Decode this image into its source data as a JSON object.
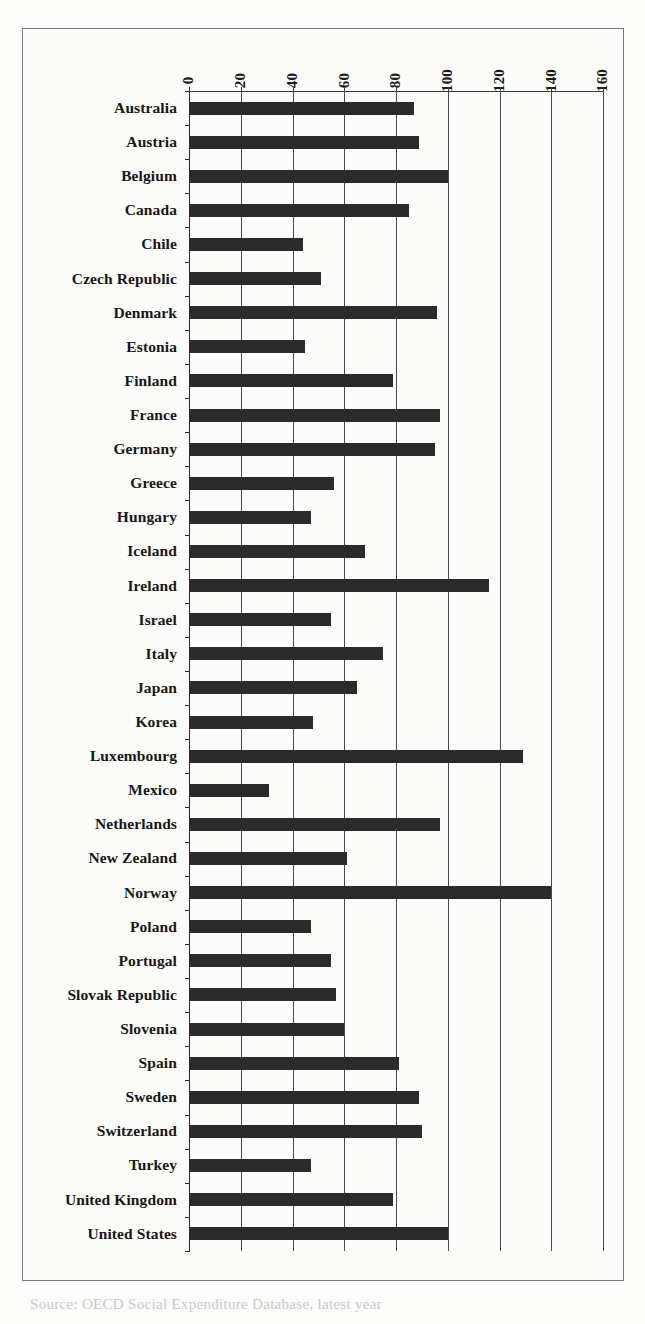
{
  "figure": {
    "caption_fragment": "Source: OECD Social Expenditure Database, latest year",
    "frame_color": "#7c7c7c",
    "bar_color": "#2b2b2b",
    "grid_color": "#4a4a4a",
    "background": "#fcfcfa"
  },
  "chart_data": {
    "type": "bar",
    "orientation": "horizontal",
    "title": "",
    "subtitle": "",
    "xlabel": "",
    "ylabel": "",
    "xlim": [
      0,
      160
    ],
    "ylim": null,
    "grid": true,
    "grid_axis": "x",
    "legend": false,
    "legend_position": "none",
    "x_axis_position": "top",
    "xticks": [
      0,
      20,
      40,
      60,
      80,
      100,
      120,
      140,
      160
    ],
    "xtick_labels": [
      "0",
      "20",
      "40",
      "60",
      "80",
      "100",
      "120",
      "140",
      "160"
    ],
    "xtick_label_rotation": -90,
    "categories": [
      "Australia",
      "Austria",
      "Belgium",
      "Canada",
      "Chile",
      "Czech Republic",
      "Denmark",
      "Estonia",
      "Finland",
      "France",
      "Germany",
      "Greece",
      "Hungary",
      "Iceland",
      "Ireland",
      "Israel",
      "Italy",
      "Japan",
      "Korea",
      "Luxembourg",
      "Mexico",
      "Netherlands",
      "New Zealand",
      "Norway",
      "Poland",
      "Portugal",
      "Slovak Republic",
      "Slovenia",
      "Spain",
      "Sweden",
      "Switzerland",
      "Turkey",
      "United Kingdom",
      "United States"
    ],
    "values": [
      87,
      89,
      100,
      85,
      44,
      51,
      96,
      45,
      79,
      97,
      95,
      56,
      47,
      68,
      116,
      55,
      75,
      65,
      48,
      129,
      31,
      97,
      61,
      140,
      47,
      55,
      57,
      60,
      81,
      89,
      90,
      47,
      79,
      100
    ]
  }
}
